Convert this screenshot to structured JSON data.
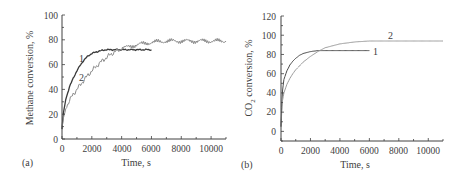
{
  "chart_data": [
    {
      "type": "line",
      "panel": "(a)",
      "xlabel": "Time, s",
      "ylabel": "Methane conversion, %",
      "xlim": [
        0,
        11000
      ],
      "ylim": [
        0,
        100
      ],
      "xticks": [
        "0",
        "2000",
        "4000",
        "6000",
        "8000",
        "10000"
      ],
      "yticks": [
        "0",
        "20",
        "40",
        "60",
        "80",
        "100"
      ],
      "grid": false,
      "series": [
        {
          "name": "1",
          "color": "#3a3a3a",
          "x": [
            0,
            100,
            250,
            500,
            750,
            1000,
            1250,
            1500,
            1750,
            2000,
            2500,
            3000,
            3500,
            4000,
            4500,
            5000,
            5500,
            6000
          ],
          "y": [
            8,
            22,
            32,
            42,
            49,
            55,
            60,
            64,
            67,
            69,
            71,
            72,
            72,
            72,
            72,
            72,
            72,
            72
          ]
        },
        {
          "name": "2",
          "color": "#8c8c8c",
          "x": [
            0,
            100,
            250,
            500,
            750,
            1000,
            1500,
            2000,
            2500,
            3000,
            3500,
            4000,
            5000,
            6000,
            7000,
            8000,
            9000,
            10000,
            11000
          ],
          "y": [
            8,
            18,
            25,
            31,
            36,
            40,
            48,
            55,
            61,
            66,
            70,
            73,
            76,
            78,
            79,
            79,
            79,
            79,
            79
          ]
        }
      ],
      "annotations": [
        {
          "text": "1",
          "x": 1150,
          "y": 64
        },
        {
          "text": "2",
          "x": 1200,
          "y": 51
        }
      ]
    },
    {
      "type": "line",
      "panel": "(b)",
      "xlabel": "Time, s",
      "ylabel": "CO2 conversion, %",
      "xlim": [
        0,
        11000
      ],
      "ylim": [
        -10,
        120
      ],
      "xticks": [
        "0",
        "2000",
        "4000",
        "6000",
        "8000",
        "10000"
      ],
      "yticks": [
        "0",
        "20",
        "40",
        "60",
        "80",
        "100",
        "120"
      ],
      "grid": false,
      "series": [
        {
          "name": "1",
          "color": "#4a4a4a",
          "x": [
            0,
            50,
            100,
            200,
            400,
            600,
            800,
            1000,
            1250,
            1500,
            2000,
            2500,
            3000,
            4000,
            5000,
            6000
          ],
          "y": [
            5,
            25,
            42,
            54,
            63,
            69,
            73,
            76,
            79,
            81,
            83,
            84,
            84,
            84,
            84,
            84
          ]
        },
        {
          "name": "2",
          "color": "#9a9a9a",
          "x": [
            0,
            50,
            100,
            200,
            400,
            600,
            800,
            1000,
            1500,
            2000,
            2500,
            3000,
            4000,
            5000,
            6000,
            8000,
            10000,
            11000
          ],
          "y": [
            5,
            20,
            32,
            40,
            49,
            55,
            60,
            64,
            72,
            78,
            83,
            87,
            91,
            93,
            94,
            94,
            94,
            94
          ]
        }
      ],
      "annotations": [
        {
          "text": "2",
          "x": 7600,
          "y": 99
        },
        {
          "text": "1",
          "x": 6600,
          "y": 83
        }
      ]
    }
  ],
  "panels": {
    "a": {
      "label": "(a)",
      "ylabel": "Methane conversion, %",
      "xlabel": "Time, s",
      "yticks": [
        "0",
        "20",
        "40",
        "60",
        "80",
        "100"
      ],
      "xticks": [
        "0",
        "2000",
        "4000",
        "6000",
        "8000",
        "10000"
      ],
      "curve1": "1",
      "curve2": "2"
    },
    "b": {
      "label": "(b)",
      "ylabel_main": "CO",
      "ylabel_sub": "2",
      "ylabel_rest": " conversion, %",
      "xlabel": "Time, s",
      "yticks": [
        "0",
        "20",
        "40",
        "60",
        "80",
        "100",
        "120"
      ],
      "xticks": [
        "0",
        "2000",
        "4000",
        "6000",
        "8000",
        "10000"
      ],
      "curve1": "1",
      "curve2": "2"
    }
  }
}
